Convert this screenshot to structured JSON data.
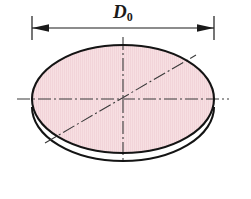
{
  "figure": {
    "kind": "engineering-drawing",
    "background_color": "#ffffff"
  },
  "dimension": {
    "symbol": "D",
    "subscript": "0",
    "full_label": "D0",
    "description": "blank outside diameter",
    "arrow_direction_left": "left",
    "arrow_direction_right": "right"
  },
  "disc": {
    "fill_color": "#f7dfe2",
    "hatch_color": "#edc9cf",
    "outline_color": "#141414",
    "outline_width": 2.1,
    "thickness_edge_color": "#141414",
    "center_x": 123,
    "center_y": 99,
    "radius_x": 91,
    "radius_y": 54,
    "thickness_offset_y": 11
  },
  "centerlines": {
    "color": "#3a3a3a",
    "width": 1.1,
    "dash_pattern": "long-dash dot",
    "horizontal": {
      "x1": 17,
      "y1": 99,
      "x2": 229,
      "y2": 99
    },
    "vertical": {
      "x1": 123,
      "y1": 37,
      "x2": 123,
      "y2": 163
    },
    "diagonal": {
      "x1": 45,
      "y1": 143,
      "x2": 196,
      "y2": 55
    }
  },
  "dimension_line": {
    "color": "#1a1a1a",
    "width": 1.2,
    "y": 28,
    "x_left": 32,
    "x_right": 214,
    "extension_color": "#1a1a1a",
    "extension_top": 16,
    "extension_bottom": 40,
    "arrow_length": 16,
    "arrow_half_height": 4
  }
}
